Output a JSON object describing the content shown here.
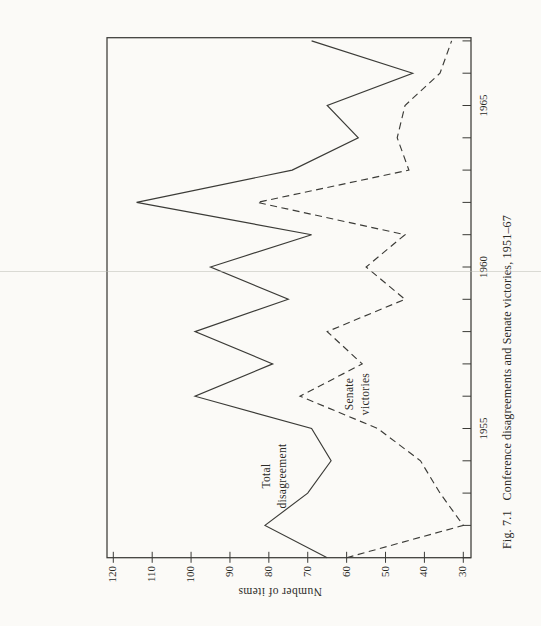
{
  "colors": {
    "paper": "#fbfaf7",
    "ink": "#3b3b37"
  },
  "figure": {
    "ylabel": "Number of items",
    "caption_prefix": "Fig. 7.1",
    "caption_text": "Conference disagreements and Senate victories, 1951–67",
    "series_labels": {
      "total": [
        "Total",
        "disagreement"
      ],
      "senate": [
        "Senate",
        "victories"
      ]
    }
  },
  "chart_data": {
    "type": "line",
    "xlabel": "",
    "ylabel": "Number of items",
    "orientation_note": "figure printed rotated 90 degrees counter-clockwise on the page",
    "grid": false,
    "xlim": [
      1951,
      1967
    ],
    "ylim": [
      30,
      120
    ],
    "x": [
      1951,
      1952,
      1953,
      1954,
      1955,
      1956,
      1957,
      1958,
      1959,
      1960,
      1961,
      1962,
      1963,
      1964,
      1965,
      1966,
      1967
    ],
    "xtick_labels": [
      "1955",
      "1960",
      "1965"
    ],
    "ytick_values": [
      30,
      40,
      50,
      60,
      70,
      80,
      90,
      100,
      110,
      120
    ],
    "series": [
      {
        "name": "Total disagreement",
        "line_style": "solid",
        "values": [
          65,
          81,
          70,
          64,
          69,
          99,
          79,
          99,
          75,
          95,
          69,
          114,
          74,
          57,
          65,
          43,
          69
        ]
      },
      {
        "name": "Senate victories",
        "line_style": "dashed",
        "values": [
          60,
          30,
          36,
          41,
          52,
          72,
          56,
          65,
          45,
          55,
          45,
          83,
          44,
          47,
          45,
          36,
          33
        ]
      }
    ]
  }
}
